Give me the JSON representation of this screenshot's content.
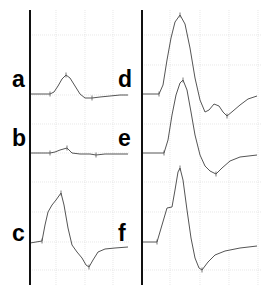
{
  "chart_data": {
    "type": "line",
    "title": "",
    "xlabel": "",
    "ylabel": "",
    "grid": true,
    "legend": "none",
    "panels": [
      {
        "name": "left-panel",
        "axis_x": 30,
        "grid_x": [
          56,
          85,
          113
        ],
        "grid_y": [
          35,
          95,
          124,
          153,
          182,
          212,
          242,
          270
        ],
        "series": [
          {
            "label": "a",
            "label_pos": [
              12,
              87
            ],
            "markers": [
              [
                50,
                94
              ],
              [
                66,
                75
              ],
              [
                92,
                98
              ]
            ],
            "points": [
              [
                30,
                94
              ],
              [
                48,
                94
              ],
              [
                50,
                94
              ],
              [
                54,
                92
              ],
              [
                58,
                86
              ],
              [
                62,
                79
              ],
              [
                66,
                75
              ],
              [
                70,
                78
              ],
              [
                75,
                86
              ],
              [
                80,
                94
              ],
              [
                85,
                98
              ],
              [
                92,
                98
              ],
              [
                100,
                97
              ],
              [
                110,
                96
              ],
              [
                120,
                95
              ],
              [
                128,
                95
              ]
            ]
          },
          {
            "label": "b",
            "label_pos": [
              12,
              146
            ],
            "markers": [
              [
                50,
                153
              ],
              [
                67,
                148
              ],
              [
                96,
                155
              ]
            ],
            "points": [
              [
                30,
                153
              ],
              [
                48,
                153
              ],
              [
                50,
                153
              ],
              [
                55,
                152
              ],
              [
                60,
                150
              ],
              [
                67,
                148
              ],
              [
                72,
                153
              ],
              [
                80,
                154
              ],
              [
                90,
                154
              ],
              [
                96,
                155
              ],
              [
                105,
                154
              ],
              [
                115,
                154
              ],
              [
                128,
                154
              ]
            ]
          },
          {
            "label": "c",
            "label_pos": [
              12,
              241
            ],
            "markers": [
              [
                42,
                241
              ],
              [
                61,
                193
              ],
              [
                89,
                267
              ]
            ],
            "points": [
              [
                30,
                243
              ],
              [
                36,
                242
              ],
              [
                42,
                241
              ],
              [
                45,
                225
              ],
              [
                48,
                212
              ],
              [
                52,
                205
              ],
              [
                56,
                200
              ],
              [
                61,
                193
              ],
              [
                64,
                205
              ],
              [
                68,
                228
              ],
              [
                72,
                245
              ],
              [
                77,
                252
              ],
              [
                82,
                258
              ],
              [
                86,
                265
              ],
              [
                89,
                267
              ],
              [
                93,
                260
              ],
              [
                98,
                252
              ],
              [
                105,
                249
              ],
              [
                115,
                248
              ],
              [
                128,
                247
              ]
            ]
          }
        ]
      },
      {
        "name": "right-panel",
        "axis_x": 142,
        "grid_x": [
          170,
          200,
          229,
          258
        ],
        "grid_y": [
          35,
          65,
          124,
          182,
          212,
          270
        ],
        "series": [
          {
            "label": "d",
            "label_pos": [
              118,
              87
            ],
            "markers": [
              [
                159,
                94
              ],
              [
                180,
                15
              ],
              [
                227,
                116
              ]
            ],
            "points": [
              [
                142,
                94
              ],
              [
                155,
                94
              ],
              [
                159,
                94
              ],
              [
                163,
                85
              ],
              [
                167,
                60
              ],
              [
                171,
                38
              ],
              [
                175,
                22
              ],
              [
                180,
                15
              ],
              [
                185,
                24
              ],
              [
                190,
                48
              ],
              [
                195,
                78
              ],
              [
                200,
                100
              ],
              [
                205,
                112
              ],
              [
                209,
                110
              ],
              [
                214,
                104
              ],
              [
                219,
                106
              ],
              [
                223,
                112
              ],
              [
                227,
                116
              ],
              [
                233,
                111
              ],
              [
                240,
                105
              ],
              [
                248,
                99
              ],
              [
                257,
                96
              ]
            ]
          },
          {
            "label": "e",
            "label_pos": [
              118,
              146
            ],
            "markers": [
              [
                164,
                153
              ],
              [
                183,
                80
              ],
              [
                216,
                174
              ]
            ],
            "points": [
              [
                142,
                153
              ],
              [
                158,
                153
              ],
              [
                164,
                153
              ],
              [
                168,
                140
              ],
              [
                172,
                115
              ],
              [
                176,
                95
              ],
              [
                180,
                83
              ],
              [
                183,
                80
              ],
              [
                187,
                90
              ],
              [
                191,
                112
              ],
              [
                195,
                135
              ],
              [
                200,
                155
              ],
              [
                205,
                166
              ],
              [
                210,
                171
              ],
              [
                216,
                174
              ],
              [
                222,
                168
              ],
              [
                230,
                161
              ],
              [
                240,
                157
              ],
              [
                257,
                155
              ]
            ]
          },
          {
            "label": "f",
            "label_pos": [
              118,
              241
            ],
            "markers": [
              [
                157,
                242
              ],
              [
                180,
                168
              ],
              [
                202,
                270
              ]
            ],
            "points": [
              [
                142,
                242
              ],
              [
                152,
                242
              ],
              [
                157,
                242
              ],
              [
                162,
                225
              ],
              [
                167,
                208
              ],
              [
                172,
                207
              ],
              [
                175,
                190
              ],
              [
                178,
                172
              ],
              [
                180,
                168
              ],
              [
                183,
                180
              ],
              [
                187,
                210
              ],
              [
                191,
                238
              ],
              [
                195,
                258
              ],
              [
                199,
                268
              ],
              [
                202,
                270
              ],
              [
                208,
                262
              ],
              [
                215,
                255
              ],
              [
                225,
                251
              ],
              [
                240,
                248
              ],
              [
                257,
                246
              ]
            ]
          }
        ]
      }
    ]
  },
  "labels": {
    "a": "a",
    "b": "b",
    "c": "c",
    "d": "d",
    "e": "e",
    "f": "f"
  }
}
